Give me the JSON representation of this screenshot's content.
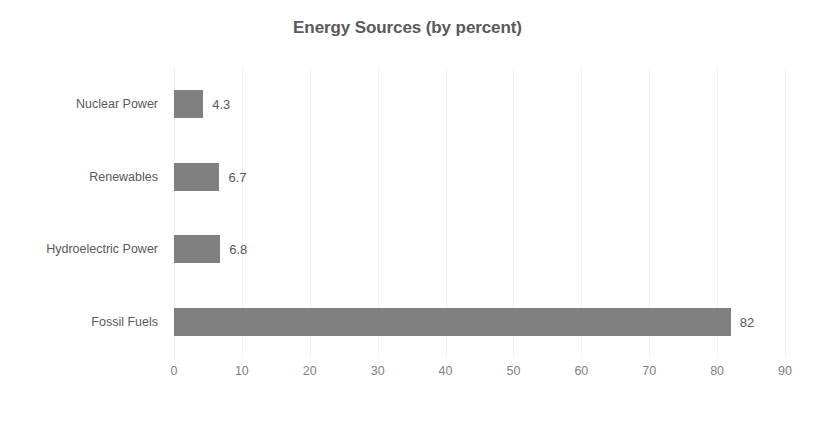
{
  "chart_data": {
    "type": "bar",
    "orientation": "horizontal",
    "title": "Energy Sources (by percent)",
    "xlabel": "",
    "ylabel": "",
    "categories": [
      "Nuclear Power",
      "Renewables",
      "Hydroelectric Power",
      "Fossil Fuels"
    ],
    "values": [
      4.3,
      6.7,
      6.8,
      82
    ],
    "value_labels": [
      "4.3",
      "6.7",
      "6.8",
      "82"
    ],
    "xlim": [
      0,
      90
    ],
    "xticks": [
      0,
      10,
      20,
      30,
      40,
      50,
      60,
      70,
      80,
      90
    ],
    "xtick_labels": [
      "0",
      "10",
      "20",
      "30",
      "40",
      "50",
      "60",
      "70",
      "80",
      "90"
    ],
    "grid": "vertical",
    "legend": "none",
    "bar_color": "#808080",
    "text_color": "#595959",
    "tick_color": "#7f7f7f",
    "gridline_color": "#f2f2f2",
    "background_color": "#ffffff"
  }
}
